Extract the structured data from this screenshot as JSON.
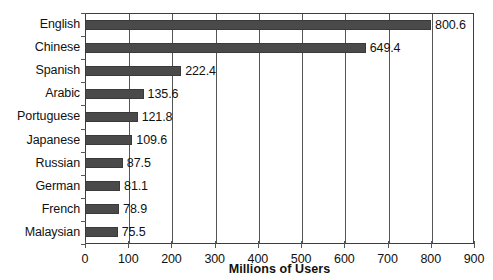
{
  "chart_data": {
    "type": "bar",
    "orientation": "horizontal",
    "title": "",
    "xlabel": "Millions of Users",
    "ylabel": "",
    "xlim": [
      0,
      900
    ],
    "xticks": [
      0,
      100,
      200,
      300,
      400,
      500,
      600,
      700,
      800,
      900
    ],
    "xtick_labels": [
      "0",
      "100",
      "200",
      "300",
      "400",
      "500",
      "600",
      "700",
      "800",
      "900"
    ],
    "grid": true,
    "grid_axis": "x",
    "legend": null,
    "categories": [
      "English",
      "Chinese",
      "Spanish",
      "Arabic",
      "Portuguese",
      "Japanese",
      "Russian",
      "German",
      "French",
      "Malaysian"
    ],
    "values": [
      800.6,
      649.4,
      222.4,
      135.6,
      121.8,
      109.6,
      87.5,
      81.1,
      78.9,
      75.5
    ],
    "value_labels": [
      "800.6",
      "649.4",
      "222.4",
      "135.6",
      "121.8",
      "109.6",
      "87.5",
      "81.1",
      "78.9",
      "75.5"
    ],
    "bar_color": "#4a4a4a",
    "bar_edge_color": "#3a3a3a",
    "frame_color": "#3d3d3d",
    "grid_color": "#555555",
    "text_color": "#111111",
    "background": "#ffffff"
  }
}
